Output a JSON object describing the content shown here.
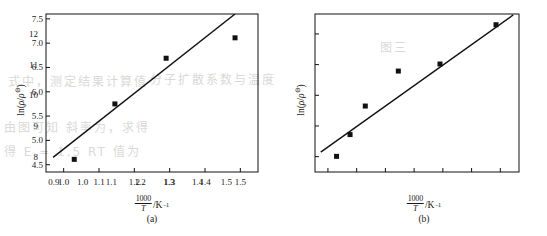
{
  "figure": {
    "background_color": "#ffffff",
    "ink_color": "#111111",
    "bleed_through_color": "#cfcdc9",
    "bleed_through_text": [
      "式中，测定结果计算值",
      "分子扩散系数与温度",
      "由图可知 斜率为，求得",
      "得 E = 1.5 RT 值为",
      "图三"
    ]
  },
  "charts": [
    {
      "id": "a",
      "caption": "(a)",
      "type": "scatter",
      "title": "",
      "xlabel_numerator": "1000",
      "xlabel_denominator": "T",
      "xlabel_unit": "/K",
      "xlabel_unit_exp": "-1",
      "ylabel_prefix": "ln(",
      "ylabel_rho": "ρ",
      "ylabel_slash": "/",
      "ylabel_rho2": "ρ",
      "ylabel_std": "⊖",
      "ylabel_suffix": ")",
      "xlim": [
        0.95,
        1.55
      ],
      "ylim": [
        4.35,
        7.6
      ],
      "xticks": [
        "1.0",
        "1.1",
        "1.2",
        "1.3",
        "1.4",
        "1.5"
      ],
      "xtick_values": [
        1.0,
        1.1,
        1.2,
        1.3,
        1.4,
        1.5
      ],
      "yticks": [
        "4.5",
        "5.0",
        "5.5",
        "6.0",
        "6.5",
        "7.0",
        "7.5"
      ],
      "ytick_values": [
        4.5,
        5.0,
        5.5,
        6.0,
        6.5,
        7.0,
        7.5
      ],
      "grid": false,
      "legend": false,
      "points": [
        {
          "x": 1.03,
          "y": 4.61
        },
        {
          "x": 1.145,
          "y": 5.75
        },
        {
          "x": 1.29,
          "y": 6.69
        },
        {
          "x": 1.485,
          "y": 7.11
        }
      ],
      "fit_line": {
        "x1": 0.97,
        "y1": 4.65,
        "x2": 1.485,
        "y2": 7.6
      }
    },
    {
      "id": "b",
      "caption": "(b)",
      "type": "scatter",
      "title": "",
      "xlabel_numerator": "1000",
      "xlabel_denominator": "T",
      "xlabel_unit": "/K",
      "xlabel_unit_exp": "-1",
      "ylabel_prefix": "ln(",
      "ylabel_rho": "ρ",
      "ylabel_slash": "/",
      "ylabel_rho2": "ρ",
      "ylabel_std": "⊖",
      "ylabel_suffix": ")",
      "xlim": [
        0.855,
        1.565
      ],
      "ylim": [
        7.5,
        12.65
      ],
      "xticks": [
        "0.9",
        "1.0",
        "1.1",
        "1.2",
        "1.3",
        "1.4",
        "1.5"
      ],
      "xtick_values": [
        0.9,
        1.0,
        1.1,
        1.2,
        1.3,
        1.4,
        1.5
      ],
      "yticks": [
        "8",
        "9",
        "10",
        "11",
        "12"
      ],
      "ytick_values": [
        8,
        9,
        10,
        11,
        12
      ],
      "grid": false,
      "legend": false,
      "points": [
        {
          "x": 0.93,
          "y": 8.01
        },
        {
          "x": 0.977,
          "y": 8.72
        },
        {
          "x": 1.03,
          "y": 9.65
        },
        {
          "x": 1.145,
          "y": 10.79
        },
        {
          "x": 1.29,
          "y": 11.02
        },
        {
          "x": 1.485,
          "y": 12.3
        }
      ],
      "fit_line": {
        "x1": 0.875,
        "y1": 8.15,
        "x2": 1.545,
        "y2": 12.62
      }
    }
  ],
  "chart_data": [
    {
      "type": "scatter",
      "id": "(a)",
      "title": "",
      "xlabel": "(1000/T)/K^-1",
      "ylabel": "ln(rho/rho^⊖)",
      "xlim": [
        0.95,
        1.55
      ],
      "ylim": [
        4.35,
        7.6
      ],
      "xticks": [
        1.0,
        1.1,
        1.2,
        1.3,
        1.4,
        1.5
      ],
      "yticks": [
        4.5,
        5.0,
        5.5,
        6.0,
        6.5,
        7.0,
        7.5
      ],
      "grid": false,
      "legend": false,
      "x": [
        1.03,
        1.145,
        1.29,
        1.485
      ],
      "values": [
        4.61,
        5.75,
        6.69,
        7.11
      ],
      "series": [
        {
          "name": "data points",
          "marker": "filled-square",
          "x": [
            1.03,
            1.145,
            1.29,
            1.485
          ],
          "values": [
            4.61,
            5.75,
            6.69,
            7.11
          ]
        },
        {
          "name": "linear fit",
          "marker": "line",
          "x": [
            0.97,
            1.485
          ],
          "values": [
            4.65,
            7.6
          ]
        }
      ]
    },
    {
      "type": "scatter",
      "id": "(b)",
      "title": "",
      "xlabel": "(1000/T)/K^-1",
      "ylabel": "ln(rho/rho^⊖)",
      "xlim": [
        0.855,
        1.565
      ],
      "ylim": [
        7.5,
        12.65
      ],
      "xticks": [
        0.9,
        1.0,
        1.1,
        1.2,
        1.3,
        1.4,
        1.5
      ],
      "yticks": [
        8,
        9,
        10,
        11,
        12
      ],
      "grid": false,
      "legend": false,
      "x": [
        0.93,
        0.977,
        1.03,
        1.145,
        1.29,
        1.485
      ],
      "values": [
        8.01,
        8.72,
        9.65,
        10.79,
        11.02,
        12.3
      ],
      "series": [
        {
          "name": "data points",
          "marker": "filled-square",
          "x": [
            0.93,
            0.977,
            1.03,
            1.145,
            1.29,
            1.485
          ],
          "values": [
            8.01,
            8.72,
            9.65,
            10.79,
            11.02,
            12.3
          ]
        },
        {
          "name": "linear fit",
          "marker": "line",
          "x": [
            0.875,
            1.545
          ],
          "values": [
            8.15,
            12.62
          ]
        }
      ]
    }
  ]
}
